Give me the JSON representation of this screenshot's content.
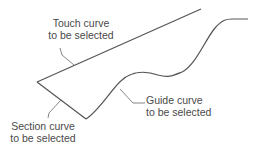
{
  "diagram": {
    "labels": {
      "touch": [
        "Touch curve",
        "to be selected"
      ],
      "guide": [
        "Guide curve",
        "to be selected"
      ],
      "section": [
        "Section curve",
        "to be selected"
      ]
    },
    "colors": {
      "curve": "#555555",
      "leader": "#666666",
      "text": "#4a4a4a",
      "background": "#ffffff"
    }
  }
}
